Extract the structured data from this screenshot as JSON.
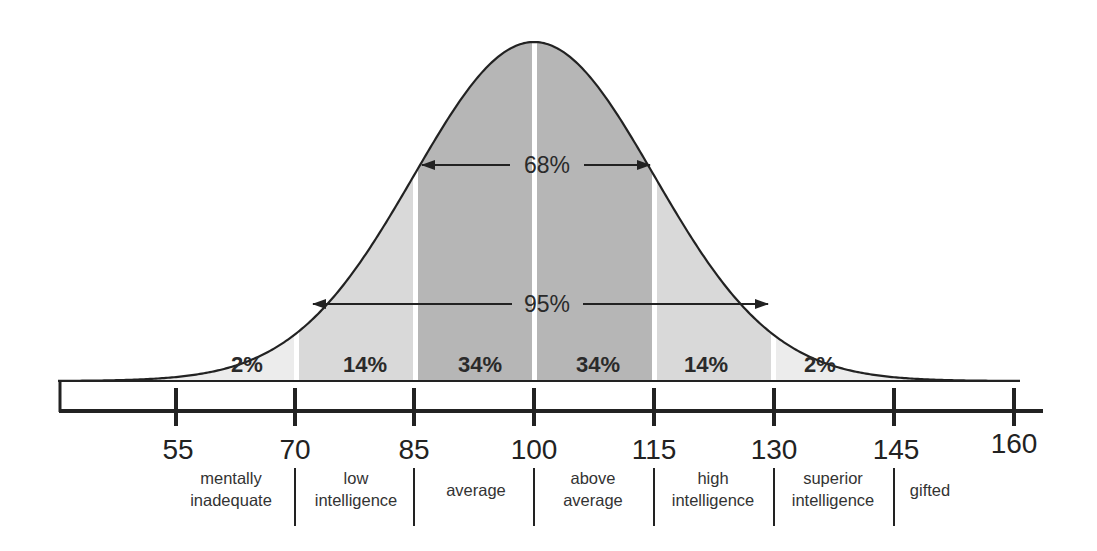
{
  "chart_data": {
    "type": "area",
    "title": "",
    "xlabel": "",
    "ylabel": "",
    "xlim": [
      40,
      163
    ],
    "mean": 100,
    "sd": 15,
    "grid": false,
    "x_ticks": [
      55,
      70,
      85,
      100,
      115,
      130,
      145,
      160
    ],
    "bands": [
      {
        "from": null,
        "to": 70,
        "percent": "2%",
        "shade": "#ececec"
      },
      {
        "from": 70,
        "to": 85,
        "percent": "14%",
        "shade": "#d9d9d9"
      },
      {
        "from": 85,
        "to": 100,
        "percent": "34%",
        "shade": "#b6b6b6"
      },
      {
        "from": 100,
        "to": 115,
        "percent": "34%",
        "shade": "#b6b6b6"
      },
      {
        "from": 115,
        "to": 130,
        "percent": "14%",
        "shade": "#d9d9d9"
      },
      {
        "from": 130,
        "to": null,
        "percent": "2%",
        "shade": "#ececec"
      }
    ],
    "annotations": [
      {
        "label": "68%",
        "from": 85,
        "to": 115,
        "type": "double-arrow"
      },
      {
        "label": "95%",
        "from": 70,
        "to": 130,
        "type": "double-arrow"
      }
    ],
    "categories": [
      {
        "from": 55,
        "to": 70,
        "label": [
          "mentally",
          "inadequate"
        ]
      },
      {
        "from": 70,
        "to": 85,
        "label": [
          "low",
          "intelligence"
        ]
      },
      {
        "from": 85,
        "to": 100,
        "label": [
          "average"
        ]
      },
      {
        "from": 100,
        "to": 115,
        "label": [
          "above",
          "average"
        ]
      },
      {
        "from": 115,
        "to": 130,
        "label": [
          "high",
          "intelligence"
        ]
      },
      {
        "from": 130,
        "to": 145,
        "label": [
          "superior",
          "intelligence"
        ]
      },
      {
        "from": 145,
        "to": 160,
        "label": [
          "gifted"
        ]
      }
    ]
  },
  "labels": {
    "pct_band_1": "2%",
    "pct_band_2": "14%",
    "pct_band_3": "34%",
    "pct_band_4": "34%",
    "pct_band_5": "14%",
    "pct_band_6": "2%",
    "arrow_68": "68%",
    "arrow_95": "95%",
    "ticks": [
      "55",
      "70",
      "85",
      "100",
      "115",
      "130",
      "145",
      "160"
    ],
    "cat_mentally_1": "mentally",
    "cat_mentally_2": "inadequate",
    "cat_low_1": "low",
    "cat_low_2": "intelligence",
    "cat_average": "average",
    "cat_above_1": "above",
    "cat_above_2": "average",
    "cat_high_1": "high",
    "cat_high_2": "intelligence",
    "cat_superior_1": "superior",
    "cat_superior_2": "intelligence",
    "cat_gifted": "gifted"
  },
  "colors": {
    "tail": "#ececec",
    "middle": "#d9d9d9",
    "center": "#b6b6b6",
    "line": "#222222",
    "separator": "#ffffff"
  }
}
